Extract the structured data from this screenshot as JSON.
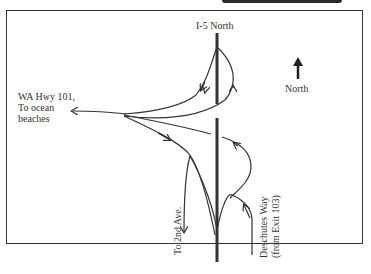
{
  "diagram": {
    "type": "highway interchange map",
    "labels": {
      "i5_north": "I-5 North",
      "wa_hwy_line1": "WA Hwy 101,",
      "wa_hwy_line2": "To ocean",
      "wa_hwy_line3": "beaches",
      "north": "North",
      "to_2nd_ave": "To 2nd Ave.",
      "deschutes_line1": "Deschutes Way",
      "deschutes_line2": "(from Exit 103)"
    },
    "icons": [
      "north-arrow-icon"
    ],
    "colors": {
      "line": "#333333",
      "frame": "#333333",
      "background": "#ffffff"
    }
  }
}
